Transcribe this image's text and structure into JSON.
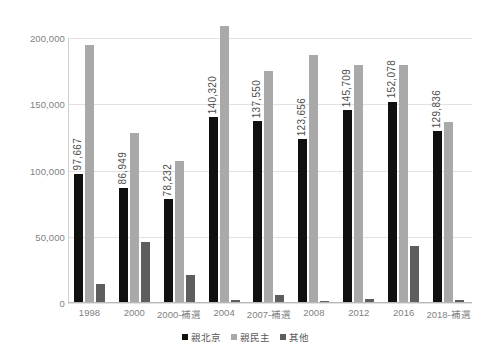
{
  "chart_data": {
    "type": "bar",
    "title": "",
    "subtitle": "",
    "xlabel": "",
    "ylabel": "",
    "ylim": [
      0,
      200000
    ],
    "yticks": [
      "0",
      "50,000",
      "100,000",
      "150,000",
      "200,000"
    ],
    "ytick_values": [
      0,
      50000,
      100000,
      150000,
      200000
    ],
    "grid": true,
    "legend_position": "bottom",
    "categories": [
      "1998",
      "2000",
      "2000-補選",
      "2004",
      "2007-補選",
      "2008",
      "2012",
      "2016",
      "2018-補選"
    ],
    "series": [
      {
        "name": "親北京",
        "color": "#101010",
        "values": [
          97667,
          86949,
          78232,
          140320,
          137550,
          123656,
          145709,
          152078,
          129836
        ],
        "labels": [
          "97,667",
          "86,949",
          "78,232",
          "140,320",
          "137,550",
          "123,656",
          "145,709",
          "152,078",
          "129,836"
        ],
        "labels_shown": true
      },
      {
        "name": "親民主",
        "color": "#a9a9a9",
        "values": [
          195000,
          128000,
          107000,
          209000,
          175000,
          187000,
          180000,
          180000,
          136500
        ],
        "labels": [
          "",
          "",
          "",
          "",
          "",
          "",
          "",
          "",
          ""
        ],
        "labels_shown": false
      },
      {
        "name": "其他",
        "color": "#5e5e5e",
        "values": [
          14000,
          46000,
          21000,
          2500,
          6000,
          1500,
          3000,
          43000,
          2500
        ],
        "labels": [
          "",
          "",
          "",
          "",
          "",
          "",
          "",
          "",
          ""
        ],
        "labels_shown": false
      }
    ]
  },
  "legend": {
    "items": [
      {
        "label": "親北京",
        "color": "#101010"
      },
      {
        "label": "親民主",
        "color": "#a9a9a9"
      },
      {
        "label": "其他",
        "color": "#5e5e5e"
      }
    ]
  }
}
